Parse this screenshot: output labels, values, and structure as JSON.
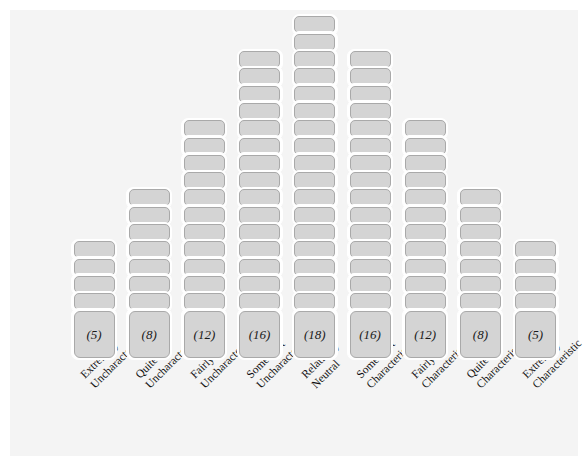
{
  "figure": {
    "kind": "q-sort-distribution",
    "background_color": "#ffffff",
    "panel_color": "#f4f4f4",
    "card_fill_color": "#d4d4d4",
    "card_border_color": "#a9a9a9",
    "card_outline_color": "#ffffff",
    "text_color": "#111111"
  },
  "chart_data": {
    "type": "bar",
    "title": "",
    "xlabel": "",
    "ylabel": "",
    "ylim": [
      0,
      18
    ],
    "grid": false,
    "legend": null,
    "categories": [
      "Extremely Uncharacteristic",
      "Quite Uncharacteristic",
      "Fairly Uncharacteristic",
      "Somewhat Uncharacteristic",
      "Relatively Neutral",
      "Somewhat Characteristic",
      "Fairly Characteristic",
      "Quite Characteristic",
      "Extremely Characteristic"
    ],
    "values": [
      5,
      8,
      12,
      16,
      18,
      16,
      12,
      8,
      5
    ],
    "value_labels": [
      "(5)",
      "(8)",
      "(12)",
      "(16)",
      "(18)",
      "(16)",
      "(12)",
      "(8)",
      "(5)"
    ]
  },
  "columns": [
    {
      "index": 0,
      "count": 5,
      "count_label": "(5)",
      "label_line1": "Extremely",
      "label_line2": "Uncharacteristic"
    },
    {
      "index": 1,
      "count": 8,
      "count_label": "(8)",
      "label_line1": "Quite",
      "label_line2": "Uncharacteristic"
    },
    {
      "index": 2,
      "count": 12,
      "count_label": "(12)",
      "label_line1": "Fairly",
      "label_line2": "Uncharacteristic"
    },
    {
      "index": 3,
      "count": 16,
      "count_label": "(16)",
      "label_line1": "Somewhat",
      "label_line2": "Uncharacteristic"
    },
    {
      "index": 4,
      "count": 18,
      "count_label": "(18)",
      "label_line1": "Relatively",
      "label_line2": "Neutral"
    },
    {
      "index": 5,
      "count": 16,
      "count_label": "(16)",
      "label_line1": "Somewhat",
      "label_line2": "Characteristic"
    },
    {
      "index": 6,
      "count": 12,
      "count_label": "(12)",
      "label_line1": "Fairly",
      "label_line2": "Characteristic"
    },
    {
      "index": 7,
      "count": 8,
      "count_label": "(8)",
      "label_line1": "Quite",
      "label_line2": "Characteristic"
    },
    {
      "index": 8,
      "count": 5,
      "count_label": "(5)",
      "label_line1": "Extremely",
      "label_line2": "Characteristic"
    }
  ]
}
